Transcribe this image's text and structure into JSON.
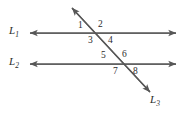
{
  "figure": {
    "background_color": "#ffffff",
    "stroke_color": "#575757",
    "text_color": "#2b2b2b"
  },
  "lines": [
    {
      "id": "L1",
      "name": "L",
      "subscript": "1",
      "label": "L1",
      "orientation": "horizontal",
      "y": 33,
      "x_start": 28,
      "x_end": 178,
      "arrows": "both",
      "label_x": 9,
      "label_y": 27
    },
    {
      "id": "L2",
      "name": "L",
      "subscript": "2",
      "label": "L2",
      "orientation": "horizontal",
      "y": 64,
      "x_start": 28,
      "x_end": 178,
      "arrows": "both",
      "label_x": 9,
      "label_y": 58
    },
    {
      "id": "L3",
      "name": "L",
      "subscript": "3",
      "label": "L3",
      "orientation": "transversal",
      "x_start": 70,
      "y_start": 6,
      "x_end": 152,
      "y_end": 94,
      "arrows": "both",
      "label_x": 150,
      "label_y": 96
    }
  ],
  "intersections": [
    {
      "id": "P1",
      "lines": [
        "L1",
        "L3"
      ],
      "x": 104,
      "y": 33
    },
    {
      "id": "P2",
      "lines": [
        "L2",
        "L3"
      ],
      "x": 127,
      "y": 64
    }
  ],
  "angles": [
    {
      "label": "1",
      "x": 78,
      "y": 21,
      "intersection": "P1",
      "position": "upper-left"
    },
    {
      "label": "2",
      "x": 98,
      "y": 20,
      "intersection": "P1",
      "position": "upper-right"
    },
    {
      "label": "3",
      "x": 88,
      "y": 36,
      "intersection": "P1",
      "position": "lower-left"
    },
    {
      "label": "4",
      "x": 108,
      "y": 36,
      "intersection": "P1",
      "position": "lower-right"
    },
    {
      "label": "5",
      "x": 101,
      "y": 51,
      "intersection": "P2",
      "position": "upper-left"
    },
    {
      "label": "6",
      "x": 122,
      "y": 50,
      "intersection": "P2",
      "position": "upper-right"
    },
    {
      "label": "7",
      "x": 113,
      "y": 67,
      "intersection": "P2",
      "position": "lower-left"
    },
    {
      "label": "8",
      "x": 133,
      "y": 67,
      "intersection": "P2",
      "position": "lower-right"
    }
  ]
}
